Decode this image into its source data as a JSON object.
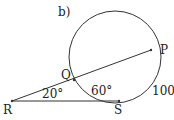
{
  "part_label": "b)",
  "points": {
    "R": "R",
    "Q": "Q",
    "P": "P",
    "S": "S"
  },
  "angles": {
    "at_R": "20°",
    "arc_QS": "60°",
    "arc_PS": "100°"
  },
  "colors": {
    "stroke": "#333333",
    "text": "#222222"
  }
}
